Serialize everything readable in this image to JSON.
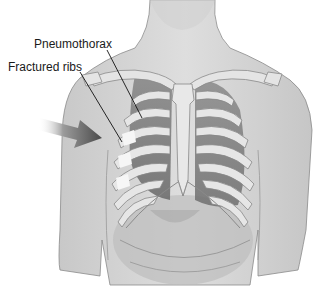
{
  "figure": {
    "labels": [
      {
        "id": "pneumothorax",
        "text": "Pneumothorax"
      },
      {
        "id": "fractured_ribs",
        "text": "Fractured ribs"
      }
    ],
    "indicator": "arrow pointing at right-side ribs (viewer's left)",
    "colors": {
      "skin": "#d6d6d6",
      "skin_shadow": "#bdbdbd",
      "bone": "#e6e6e6",
      "bone_outline": "#8a8a8a",
      "lung_dark": "#7d7d7d",
      "lung_mid": "#9a9a9a",
      "fracture_highlight": "#f4f4f4",
      "arrow": "#5a5a5a",
      "leader_line": "#111111",
      "background": "#ffffff"
    }
  }
}
